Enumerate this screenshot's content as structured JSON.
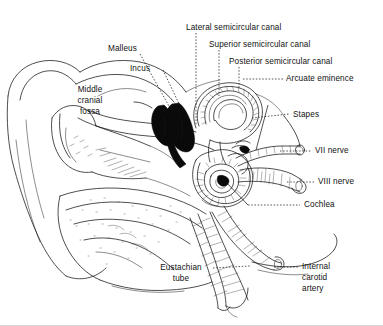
{
  "figure": {
    "type": "line-art anatomical illustration",
    "background_color": "#ffffff",
    "ink_color": "#111111"
  },
  "labels": [
    {
      "id": "lateral-semicircular-canal",
      "text": "Lateral semicircular canal"
    },
    {
      "id": "superior-semicircular-canal",
      "text": "Superior semicircular canal"
    },
    {
      "id": "posterior-semicircular-canal",
      "text": "Posterior semicircular canal"
    },
    {
      "id": "arcuate-eminence",
      "text": "Arcuate eminence"
    },
    {
      "id": "malleus",
      "text": "Malleus"
    },
    {
      "id": "incus",
      "text": "Incus"
    },
    {
      "id": "middle-cranial-fossa-line1",
      "text": "Middle"
    },
    {
      "id": "middle-cranial-fossa-line2",
      "text": "cranial"
    },
    {
      "id": "middle-cranial-fossa-line3",
      "text": "fossa"
    },
    {
      "id": "stapes",
      "text": "Stapes"
    },
    {
      "id": "vii-nerve",
      "text": "VII nerve"
    },
    {
      "id": "viii-nerve",
      "text": "VIII nerve"
    },
    {
      "id": "cochlea",
      "text": "Cochlea"
    },
    {
      "id": "eustachian-tube-line1",
      "text": "Eustachian"
    },
    {
      "id": "eustachian-tube-line2",
      "text": "tube"
    },
    {
      "id": "internal-carotid-artery-line1",
      "text": "Internal"
    },
    {
      "id": "internal-carotid-artery-line2",
      "text": "carotid"
    },
    {
      "id": "internal-carotid-artery-line3",
      "text": "artery"
    }
  ],
  "text": {
    "lateral_semicircular_canal": "Lateral semicircular canal",
    "superior_semicircular_canal": "Superior semicircular canal",
    "posterior_semicircular_canal": "Posterior semicircular canal",
    "arcuate_eminence": "Arcuate eminence",
    "malleus": "Malleus",
    "incus": "Incus",
    "middle_cranial_fossa": {
      "line1": "Middle",
      "line2": "cranial",
      "line3": "fossa"
    },
    "stapes": "Stapes",
    "vii_nerve": "VII nerve",
    "viii_nerve": "VIII nerve",
    "cochlea": "Cochlea",
    "eustachian_tube": {
      "line1": "Eustachian",
      "line2": "tube"
    },
    "internal_carotid_artery": {
      "line1": "Internal",
      "line2": "carotid",
      "line3": "artery"
    }
  }
}
